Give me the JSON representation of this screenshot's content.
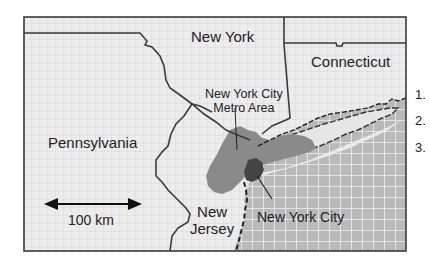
{
  "map": {
    "labels": {
      "new_york": "New York",
      "connecticut": "Connecticut",
      "pennsylvania": "Pennsylvania",
      "new_jersey_line1": "New",
      "new_jersey_line2": "Jersey",
      "metro_line1": "New York City",
      "metro_line2": "Metro Area",
      "nyc": "New York City"
    },
    "scale_bar": {
      "label": "100 km"
    },
    "colors": {
      "land": "#ececec",
      "land_grid": "#d4d4d4",
      "water": "#b9b9b9",
      "water_grid": "#f2f2f2",
      "metro_area": "#8a8a8a",
      "nyc": "#444444",
      "long_island_east": "#e6e6e6",
      "border": "#3a3a3a"
    }
  },
  "legend": {
    "items": [
      "1.",
      "2.",
      "3."
    ]
  }
}
